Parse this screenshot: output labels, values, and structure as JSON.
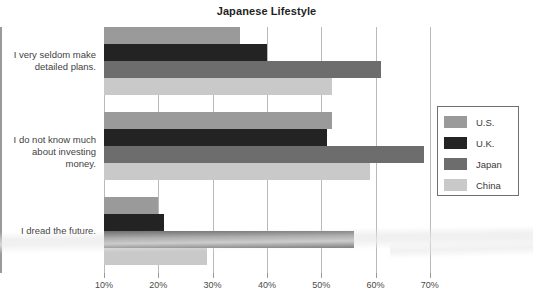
{
  "chart_data": {
    "type": "bar",
    "orientation": "horizontal",
    "title": "Japanese Lifestyle",
    "xlabel": "",
    "ylabel": "",
    "xlim": [
      10,
      70
    ],
    "xticks": [
      10,
      20,
      30,
      40,
      50,
      60,
      70
    ],
    "xtick_labels": [
      "10%",
      "20%",
      "30%",
      "40%",
      "50%",
      "60%",
      "70%"
    ],
    "grid": true,
    "legend_position": "right",
    "categories": [
      "I very seldom make detailed plans.",
      "I do not know much about investing money.",
      "I dread the future."
    ],
    "category_lines": [
      [
        "I very seldom make",
        "detailed plans."
      ],
      [
        "I do not know much",
        "about investing money."
      ],
      [
        "I dread the future."
      ]
    ],
    "series": [
      {
        "name": "U.S.",
        "color": "#9a9a9a",
        "values": [
          35,
          52,
          20
        ]
      },
      {
        "name": "U.K.",
        "color": "#232323",
        "values": [
          40,
          51,
          21
        ]
      },
      {
        "name": "Japan",
        "color": "#6d6d6d",
        "values": [
          61,
          69,
          56
        ]
      },
      {
        "name": "China",
        "color": "#c9c9c9",
        "values": [
          52,
          59,
          29
        ]
      }
    ]
  },
  "legend": {
    "items": [
      {
        "label": "U.S."
      },
      {
        "label": "U.K."
      },
      {
        "label": "Japan"
      },
      {
        "label": "China"
      }
    ]
  }
}
